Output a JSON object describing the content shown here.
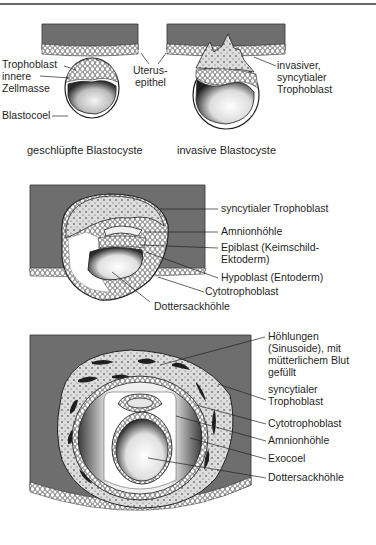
{
  "figure": {
    "colors": {
      "uterus_tissue": "#6e6e6e",
      "outline": "#2a2a2a",
      "syncytium_fill": "#d9d9d9",
      "background": "#ffffff",
      "text": "#1f1f1f"
    },
    "panel_a": {
      "left": {
        "caption": "geschlüpfte Blastocyste",
        "labels": {
          "trophoblast": "Trophoblast",
          "inner_cell_mass_line1": "innere",
          "inner_cell_mass_line2": "Zellmasse",
          "blastocoel": "Blastocoel"
        }
      },
      "center_label": {
        "line1": "Uterus-",
        "line2": "epithel"
      },
      "right": {
        "caption": "invasive Blastocyste",
        "labels": {
          "line1": "invasiver,",
          "line2": "syncytialer",
          "line3": "Trophoblast"
        }
      }
    },
    "panel_b": {
      "labels": {
        "syncytial_trophoblast": "syncytialer Trophoblast",
        "amnion_cavity": "Amnionhöhle",
        "epiblast_line1": "Epiblast (Keimschild-",
        "epiblast_line2": "Ektoderm)",
        "hypoblast": "Hypoblast (Entoderm)",
        "cytotrophoblast": "Cytotrophoblast",
        "yolk_sac_cavity": "Dottersackhöhle"
      }
    },
    "panel_c": {
      "labels": {
        "lacunae_line1": "Höhlungen",
        "lacunae_line2": "(Sinusoide), mit",
        "lacunae_line3": "mütterlichem Blut",
        "lacunae_line4": "gefüllt",
        "syncytial_line1": "syncytialer",
        "syncytial_line2": "Trophoblast",
        "cytotrophoblast": "Cytotrophoblast",
        "amnion_cavity": "Amnionhöhle",
        "exocoelom": "Exocoel",
        "yolk_sac_cavity": "Dottersackhöhle"
      }
    }
  }
}
